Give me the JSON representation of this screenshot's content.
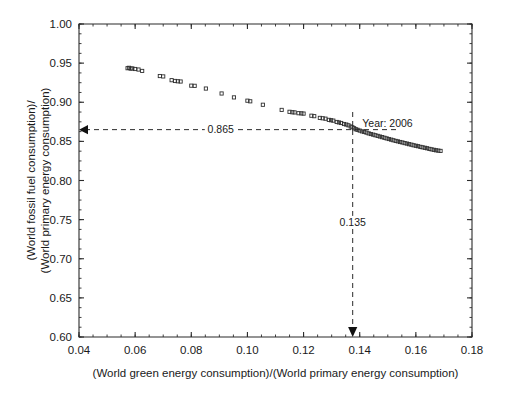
{
  "chart_data": {
    "type": "scatter",
    "title": "",
    "xlabel": "(World green energy consumption)/(World primary energy consumption)",
    "ylabel_line1": "(World fossil fuel consumption)/",
    "ylabel_line2": "(World primary energy consumption)",
    "xlim": [
      0.04,
      0.18
    ],
    "ylim": [
      0.6,
      1.0
    ],
    "xticks": [
      "0.04",
      "0.06",
      "0.08",
      "0.10",
      "0.12",
      "0.14",
      "0.16",
      "0.18"
    ],
    "xtick_values": [
      0.04,
      0.06,
      0.08,
      0.1,
      0.12,
      0.14,
      0.16,
      0.18
    ],
    "yticks": [
      "0.60",
      "0.65",
      "0.70",
      "0.75",
      "0.80",
      "0.85",
      "0.90",
      "0.95",
      "1.00"
    ],
    "ytick_values": [
      0.6,
      0.65,
      0.7,
      0.75,
      0.8,
      0.85,
      0.9,
      0.95,
      1.0
    ],
    "x_minor_step": 0.005,
    "y_minor_step": 0.0125,
    "grid": false,
    "legend": "none",
    "marker": "open-square",
    "series": [
      {
        "name": "World energy mix",
        "points": [
          [
            0.0573,
            0.9435
          ],
          [
            0.0578,
            0.944
          ],
          [
            0.0584,
            0.943
          ],
          [
            0.059,
            0.9432
          ],
          [
            0.06,
            0.9425
          ],
          [
            0.0612,
            0.9418
          ],
          [
            0.0625,
            0.94
          ],
          [
            0.0688,
            0.9335
          ],
          [
            0.07,
            0.933
          ],
          [
            0.073,
            0.9282
          ],
          [
            0.0742,
            0.9272
          ],
          [
            0.0752,
            0.9268
          ],
          [
            0.0762,
            0.9265
          ],
          [
            0.08,
            0.9212
          ],
          [
            0.0812,
            0.921
          ],
          [
            0.0852,
            0.9175
          ],
          [
            0.0908,
            0.9112
          ],
          [
            0.0952,
            0.9062
          ],
          [
            0.1,
            0.902
          ],
          [
            0.101,
            0.9012
          ],
          [
            0.1055,
            0.8968
          ],
          [
            0.1122,
            0.8902
          ],
          [
            0.115,
            0.8878
          ],
          [
            0.116,
            0.8872
          ],
          [
            0.1168,
            0.887
          ],
          [
            0.1182,
            0.886
          ],
          [
            0.1192,
            0.8858
          ],
          [
            0.12,
            0.8855
          ],
          [
            0.1228,
            0.8828
          ],
          [
            0.1238,
            0.8822
          ],
          [
            0.1258,
            0.88
          ],
          [
            0.1268,
            0.8795
          ],
          [
            0.1278,
            0.879
          ],
          [
            0.129,
            0.8775
          ],
          [
            0.1298,
            0.877
          ],
          [
            0.1306,
            0.8765
          ],
          [
            0.1318,
            0.8748
          ],
          [
            0.1326,
            0.8742
          ],
          [
            0.1334,
            0.8735
          ],
          [
            0.1344,
            0.8722
          ],
          [
            0.1352,
            0.8715
          ],
          [
            0.136,
            0.8705
          ],
          [
            0.1368,
            0.869
          ],
          [
            0.1374,
            0.868
          ],
          [
            0.138,
            0.8668
          ],
          [
            0.1386,
            0.8655
          ],
          [
            0.1392,
            0.8648
          ],
          [
            0.14,
            0.8638
          ],
          [
            0.1408,
            0.8628
          ],
          [
            0.1416,
            0.862
          ],
          [
            0.1424,
            0.8612
          ],
          [
            0.1432,
            0.8602
          ],
          [
            0.144,
            0.8594
          ],
          [
            0.1448,
            0.8586
          ],
          [
            0.1456,
            0.8578
          ],
          [
            0.1464,
            0.857
          ],
          [
            0.1472,
            0.8562
          ],
          [
            0.148,
            0.8554
          ],
          [
            0.1488,
            0.8546
          ],
          [
            0.1496,
            0.8538
          ],
          [
            0.1504,
            0.853
          ],
          [
            0.1512,
            0.8522
          ],
          [
            0.152,
            0.8514
          ],
          [
            0.1528,
            0.8506
          ],
          [
            0.1536,
            0.85
          ],
          [
            0.1544,
            0.8492
          ],
          [
            0.1552,
            0.8486
          ],
          [
            0.156,
            0.8478
          ],
          [
            0.1568,
            0.8472
          ],
          [
            0.1576,
            0.8464
          ],
          [
            0.1584,
            0.8458
          ],
          [
            0.1592,
            0.845
          ],
          [
            0.16,
            0.8444
          ],
          [
            0.1608,
            0.8438
          ],
          [
            0.1616,
            0.843
          ],
          [
            0.1624,
            0.8424
          ],
          [
            0.1632,
            0.8418
          ],
          [
            0.164,
            0.8412
          ],
          [
            0.1648,
            0.8404
          ],
          [
            0.1656,
            0.8398
          ],
          [
            0.1664,
            0.8392
          ],
          [
            0.1672,
            0.8386
          ],
          [
            0.168,
            0.8382
          ],
          [
            0.1688,
            0.8378
          ]
        ]
      }
    ],
    "annotations": [
      {
        "id": "year-callout",
        "text": "Year: 2006",
        "x": 0.1395,
        "y": 0.8705
      },
      {
        "id": "y-guide-value",
        "text": "0.865",
        "x": 0.0905,
        "y": 0.865,
        "guide": "horizontal",
        "arrow": "left"
      },
      {
        "id": "x-guide-value",
        "text": "0.135",
        "x": 0.1375,
        "y": 0.742,
        "guide": "vertical",
        "arrow": "down"
      }
    ],
    "reference_lines": [
      {
        "id": "horizontal-reference",
        "orientation": "horizontal",
        "value": 0.865,
        "label": "0.865",
        "style": "dashed"
      },
      {
        "id": "vertical-reference",
        "orientation": "vertical",
        "value": 0.1375,
        "label": "0.135",
        "style": "dashed"
      }
    ],
    "highlight_point": {
      "label": "Year: 2006",
      "x": 0.1375,
      "y": 0.865
    }
  },
  "colors": {
    "axis": "#2b2b2b",
    "marker_stroke": "#2f2f2f",
    "guide": "#2b2b2b",
    "text": "#1a1a1a",
    "background": "#ffffff"
  }
}
